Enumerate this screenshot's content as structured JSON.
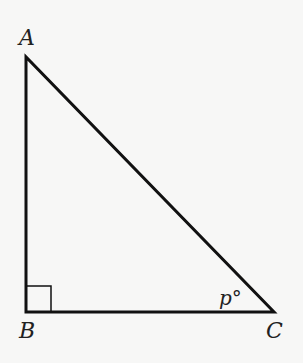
{
  "diagram": {
    "type": "right-triangle",
    "vertices": {
      "A": {
        "label": "A",
        "x": 26,
        "y": 57
      },
      "B": {
        "label": "B",
        "x": 26,
        "y": 312
      },
      "C": {
        "label": "C",
        "x": 274,
        "y": 312
      }
    },
    "right_angle_at": "B",
    "angle_label": {
      "vertex": "C",
      "text": "p°"
    },
    "stroke_color": "#111111",
    "background": "#f7f7f6"
  }
}
